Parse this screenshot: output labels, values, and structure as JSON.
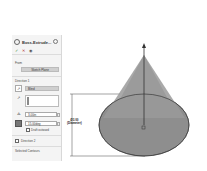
{
  "panel": {
    "title": "Boss-Extrude...",
    "actions": {
      "ok": "✓",
      "cancel": "✕",
      "preview": "👁"
    },
    "from": {
      "label": "From",
      "value": "Sketch Plane"
    },
    "direction1": {
      "label": "Direction 1",
      "end_condition": "Blind",
      "depth": "3.00in",
      "draft_angle": "15.00deg",
      "draft_outward_label": "Draft outward"
    },
    "direction2": {
      "label": "Direction 2"
    },
    "selected_contours": {
      "label": "Selected Contours"
    }
  },
  "canvas": {
    "dimension": {
      "value": "Ø3.00",
      "label": "(Diameter)"
    },
    "colors": {
      "cone_fill": "#9a9a9a",
      "base_fill": "#8c8c8c",
      "edge": "#333333"
    }
  }
}
